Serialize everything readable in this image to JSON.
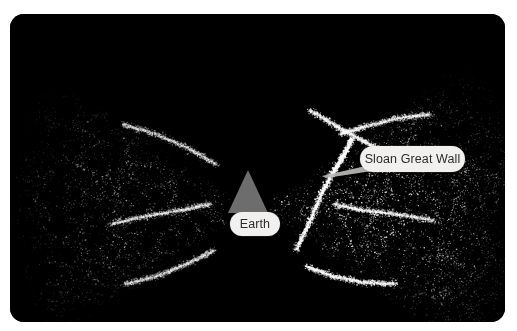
{
  "figure": {
    "kind": "sky-survey-map",
    "background_color": "#ffffff",
    "panel_color": "#000000",
    "panel_radius_px": 14,
    "width_px": 517,
    "height_px": 331
  },
  "labels": {
    "earth": {
      "text": "Earth",
      "pill_color": "#f1f0ee",
      "text_color": "#2b2b2b"
    },
    "sloan": {
      "text": "Sloan Great Wall",
      "pill_color": "#f1f0ee",
      "text_color": "#2b2b2b"
    }
  },
  "markers": {
    "earth_cone": {
      "name": "observer-cone",
      "fill_color": "#6d6d6d"
    }
  },
  "chart_data": {
    "type": "scatter",
    "title": "",
    "subtitle": "",
    "xlabel": "",
    "ylabel": "",
    "grid": false,
    "legend_position": "none",
    "annotations": [
      {
        "label": "Earth",
        "x_px": 245,
        "y_px": 210
      },
      {
        "label": "Sloan Great Wall",
        "x_px": 402,
        "y_px": 145
      }
    ],
    "series": [
      {
        "name": "Left survey wedge galaxies",
        "point_color": "#cfcfcf",
        "apex_px": [
          245,
          195
        ],
        "half_angle_deg": 34,
        "direction_deg": 180,
        "radius_px": 250,
        "approx_point_count": 2600,
        "brightness": 0.62
      },
      {
        "name": "Right survey wedge galaxies",
        "point_color": "#f2f2f2",
        "apex_px": [
          248,
          195
        ],
        "half_angle_deg": 36,
        "direction_deg": 0,
        "radius_px": 265,
        "approx_point_count": 4200,
        "brightness": 1.0
      }
    ],
    "filaments": [
      {
        "name": "Sloan Great Wall",
        "brightness": 1.0,
        "path_px": [
          [
            286,
            236
          ],
          [
            300,
            206
          ],
          [
            312,
            178
          ],
          [
            324,
            156
          ],
          [
            334,
            140
          ],
          [
            342,
            124
          ]
        ]
      },
      {
        "name": "right-wedge-filament-a",
        "brightness": 0.8,
        "path_px": [
          [
            300,
            96
          ],
          [
            326,
            112
          ],
          [
            352,
            126
          ],
          [
            378,
            140
          ]
        ]
      },
      {
        "name": "right-wedge-filament-b",
        "brightness": 0.8,
        "path_px": [
          [
            296,
            252
          ],
          [
            322,
            262
          ],
          [
            352,
            268
          ],
          [
            386,
            270
          ]
        ]
      },
      {
        "name": "right-wedge-filament-c",
        "brightness": 0.7,
        "path_px": [
          [
            330,
            120
          ],
          [
            356,
            112
          ],
          [
            388,
            104
          ],
          [
            420,
            100
          ]
        ]
      },
      {
        "name": "right-wedge-filament-d",
        "brightness": 0.7,
        "path_px": [
          [
            324,
            190
          ],
          [
            352,
            196
          ],
          [
            386,
            200
          ],
          [
            424,
            206
          ]
        ]
      },
      {
        "name": "left-wedge-filament-a",
        "brightness": 0.55,
        "path_px": [
          [
            200,
            190
          ],
          [
            170,
            196
          ],
          [
            136,
            202
          ],
          [
            100,
            210
          ]
        ]
      },
      {
        "name": "left-wedge-filament-b",
        "brightness": 0.5,
        "path_px": [
          [
            206,
            150
          ],
          [
            178,
            134
          ],
          [
            146,
            120
          ],
          [
            112,
            110
          ]
        ]
      },
      {
        "name": "left-wedge-filament-c",
        "brightness": 0.5,
        "path_px": [
          [
            204,
            236
          ],
          [
            176,
            250
          ],
          [
            146,
            262
          ],
          [
            114,
            270
          ]
        ]
      }
    ],
    "xlim": [
      0,
      495
    ],
    "ylim": [
      0,
      308
    ]
  }
}
